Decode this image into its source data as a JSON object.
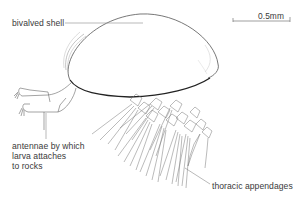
{
  "diagram": {
    "labels": {
      "shell": "bivalved shell",
      "antennae_lines": [
        "antennae by which",
        "larva attaches",
        "to rocks"
      ],
      "thoracic": "thoracic appendages",
      "scale": "0.5mm"
    },
    "colors": {
      "line": "#3a3a3a",
      "leader": "#8a8a8a",
      "text": "#3a3a3a",
      "background": "#ffffff"
    }
  }
}
